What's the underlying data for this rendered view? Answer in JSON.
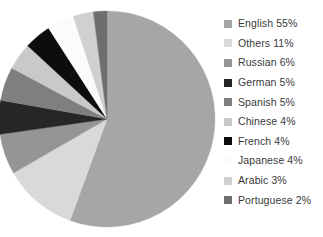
{
  "chart_data": {
    "type": "pie",
    "title": "",
    "xlabel": "",
    "ylabel": "",
    "legend_position": "right",
    "grid": false,
    "start_angle_deg": 0,
    "direction": "clockwise",
    "categories": [
      "English",
      "Others",
      "Russian",
      "German",
      "Spanish",
      "Chinese",
      "French",
      "Japanese",
      "Arabic",
      "Portuguese"
    ],
    "values": [
      55,
      11,
      6,
      5,
      5,
      4,
      4,
      4,
      3,
      2
    ],
    "unit": "%",
    "colors": [
      "#a6a6a6",
      "#d9d9d9",
      "#959595",
      "#262626",
      "#7f7f7f",
      "#c9c9c9",
      "#0d0d0d",
      "#fbfbfb",
      "#d0d0d0",
      "#6e6e6e"
    ],
    "slices": [
      {
        "label": "English",
        "value": 55,
        "display": "English 55%",
        "color": "#a6a6a6"
      },
      {
        "label": "Others",
        "value": 11,
        "display": "Others 11%",
        "color": "#d9d9d9"
      },
      {
        "label": "Russian",
        "value": 6,
        "display": "Russian 6%",
        "color": "#959595"
      },
      {
        "label": "German",
        "value": 5,
        "display": "German 5%",
        "color": "#262626"
      },
      {
        "label": "Spanish",
        "value": 5,
        "display": "Spanish 5%",
        "color": "#7f7f7f"
      },
      {
        "label": "Chinese",
        "value": 4,
        "display": "Chinese 4%",
        "color": "#c9c9c9"
      },
      {
        "label": "French",
        "value": 4,
        "display": "French 4%",
        "color": "#0d0d0d"
      },
      {
        "label": "Japanese",
        "value": 4,
        "display": "Japanese 4%",
        "color": "#fbfbfb"
      },
      {
        "label": "Arabic",
        "value": 3,
        "display": "Arabic 3%",
        "color": "#d0d0d0"
      },
      {
        "label": "Portuguese",
        "value": 2,
        "display": "Portuguese 2%",
        "color": "#6e6e6e"
      }
    ]
  },
  "legend": {
    "items": [
      {
        "label": "English 55%",
        "color": "#a6a6a6"
      },
      {
        "label": "Others 11%",
        "color": "#d9d9d9"
      },
      {
        "label": "Russian 6%",
        "color": "#959595"
      },
      {
        "label": "German 5%",
        "color": "#262626"
      },
      {
        "label": "Spanish 5%",
        "color": "#7f7f7f"
      },
      {
        "label": "Chinese 4%",
        "color": "#c9c9c9"
      },
      {
        "label": "French 4%",
        "color": "#0d0d0d"
      },
      {
        "label": "Japanese 4%",
        "color": "#fbfbfb"
      },
      {
        "label": "Arabic 3%",
        "color": "#d0d0d0"
      },
      {
        "label": "Portuguese 2%",
        "color": "#6e6e6e"
      }
    ]
  },
  "geometry": {
    "center_x": 107,
    "center_y": 119,
    "radius": 108
  }
}
